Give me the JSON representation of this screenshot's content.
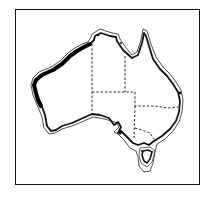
{
  "map": {
    "subject": "Australia",
    "style": "black-and-white line drawing",
    "colors": {
      "background": "#ffffff",
      "line": "#111111",
      "highlight": "#000000"
    },
    "layers": [
      {
        "name": "frame",
        "type": "rectangle border"
      },
      {
        "name": "coastline",
        "type": "solid outline"
      },
      {
        "name": "offshore-boundary",
        "type": "thin offset outline"
      },
      {
        "name": "state-borders",
        "type": "dashed lines"
      },
      {
        "name": "highlighted-coast",
        "type": "thick line",
        "region": "western coast"
      },
      {
        "name": "tasmania",
        "type": "island outline"
      }
    ]
  }
}
